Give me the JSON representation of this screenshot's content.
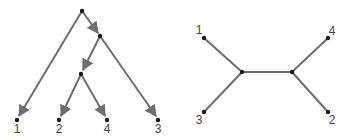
{
  "rooted_tree": {
    "edge_color": "#6e6e6e",
    "node_color": "#1a1a1a",
    "nodes": {
      "root": {
        "x": 82,
        "y": 11
      },
      "a": {
        "x": 100,
        "y": 36
      },
      "b": {
        "x": 81,
        "y": 74
      },
      "leaf1": {
        "x": 17,
        "y": 120,
        "label": "1"
      },
      "leaf2": {
        "x": 59,
        "y": 120,
        "label": "2"
      },
      "leaf4": {
        "x": 107,
        "y": 120,
        "label": "4"
      },
      "leaf3": {
        "x": 158,
        "y": 120,
        "label": "3"
      }
    },
    "labels": [
      "1",
      "2",
      "4",
      "3"
    ]
  },
  "unrooted_tree": {
    "edge_color": "#6e6e6e",
    "node_color": "#1a1a1a",
    "labels": [
      "1",
      "4",
      "3",
      "2"
    ]
  }
}
